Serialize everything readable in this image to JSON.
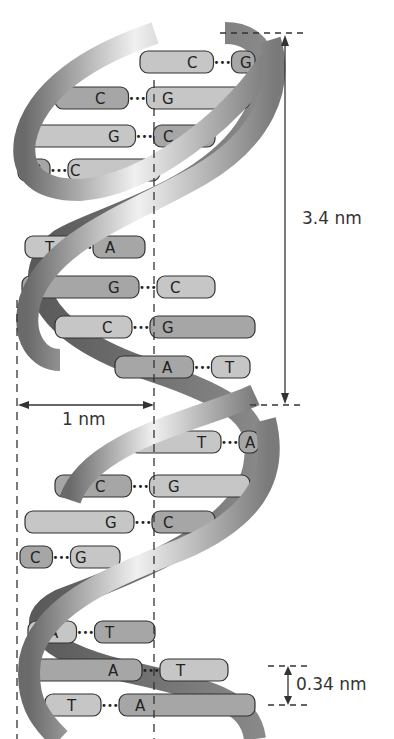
{
  "figure": {
    "type": "DNA double helix structure",
    "colors": {
      "backbone_light": "#e8e8e8",
      "backbone_mid": "#a8a8a8",
      "backbone_dark": "#6a6a6a",
      "base_light": "#c4c4c4",
      "base_dark": "#9a9a9a",
      "outline": "#333333",
      "dimension_line": "#333333"
    }
  },
  "dimensions": {
    "pitch": "3.4 nm",
    "radius": "1 nm",
    "base_spacing": "0.34 nm"
  },
  "base_pairs": [
    {
      "left": "C",
      "right": "G"
    },
    {
      "left": "C",
      "right": "G"
    },
    {
      "left": "G",
      "right": "C"
    },
    {
      "left": "G",
      "right": "C"
    },
    {
      "left": "T",
      "right": "A"
    },
    {
      "left": "G",
      "right": "C"
    },
    {
      "left": "C",
      "right": "G"
    },
    {
      "left": "A",
      "right": "T"
    },
    {
      "left": "T",
      "right": "A"
    },
    {
      "left": "C",
      "right": "G"
    },
    {
      "left": "G",
      "right": "C"
    },
    {
      "left": "C",
      "right": "G"
    },
    {
      "left": "A",
      "right": "T"
    },
    {
      "left": "A",
      "right": "T"
    },
    {
      "left": "T",
      "right": "A"
    }
  ],
  "bond_glyph": "•••"
}
